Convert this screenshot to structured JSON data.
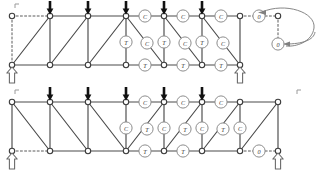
{
  "figure": {
    "colors": {
      "member": "#4a4a4a",
      "node_stroke": "#3d3d3d",
      "node_fill": "#ffffff",
      "label_circle": "#8d8d8d",
      "label_text": "#3a3a3a",
      "load_arrow": "#111111",
      "support": "#6a6a6a",
      "dashed": "#5a5a5a",
      "callout": "#808080",
      "background": "#ffffff"
    },
    "legend_meaning": {
      "C": "compression",
      "T": "tension",
      "0": "zero-force member"
    }
  },
  "trusses": [
    {
      "id": "upper-truss",
      "name": "upper-truss",
      "top_chord_y": 16,
      "bottom_chord_y": 65,
      "panel_x": [
        12,
        50,
        88,
        126,
        164,
        202,
        240,
        278
      ],
      "loads": [
        {
          "name": "load-arrow-1",
          "x": 50
        },
        {
          "name": "load-arrow-2",
          "x": 88
        },
        {
          "name": "load-arrow-3",
          "x": 126
        },
        {
          "name": "load-arrow-4",
          "x": 164
        },
        {
          "name": "load-arrow-5",
          "x": 202
        }
      ],
      "supports": [
        {
          "name": "support-left",
          "x": 12,
          "y": 65
        },
        {
          "name": "support-right",
          "x": 240,
          "y": 65
        }
      ],
      "top_nodes": [
        12,
        50,
        88,
        126,
        164,
        202,
        240,
        278
      ],
      "bottom_nodes": [
        12,
        50,
        88,
        126,
        164,
        202,
        240
      ],
      "dashed_members": [
        {
          "name": "dashed-top-overhang-left",
          "x1": 12,
          "y1": 16,
          "x2": 50,
          "y2": 16
        },
        {
          "name": "dashed-vertical-left",
          "x1": 12,
          "y1": 16,
          "x2": 12,
          "y2": 65
        },
        {
          "name": "dashed-top-overhang-right",
          "x1": 240,
          "y1": 16,
          "x2": 278,
          "y2": 16
        },
        {
          "name": "dashed-vertical-right",
          "x1": 278,
          "y1": 16,
          "x2": 278,
          "y2": 44
        }
      ],
      "labels": [
        {
          "name": "force-label-top-1",
          "x": 145,
          "y": 16,
          "text": "C"
        },
        {
          "name": "force-label-top-2",
          "x": 183,
          "y": 16,
          "text": "C"
        },
        {
          "name": "force-label-top-3",
          "x": 221,
          "y": 16,
          "text": "C"
        },
        {
          "name": "force-label-top-4",
          "x": 259,
          "y": 16,
          "text": "0"
        },
        {
          "name": "force-label-mid-1",
          "x": 126,
          "y": 42,
          "text": "T"
        },
        {
          "name": "force-label-mid-2",
          "x": 147,
          "y": 43,
          "text": "C"
        },
        {
          "name": "force-label-mid-3",
          "x": 164,
          "y": 42,
          "text": "T"
        },
        {
          "name": "force-label-mid-4",
          "x": 185,
          "y": 43,
          "text": "C"
        },
        {
          "name": "force-label-mid-5",
          "x": 202,
          "y": 42,
          "text": "T"
        },
        {
          "name": "force-label-mid-6",
          "x": 223,
          "y": 43,
          "text": "C"
        },
        {
          "name": "force-label-mid-7",
          "x": 278,
          "y": 44,
          "text": "0"
        },
        {
          "name": "force-label-bot-1",
          "x": 145,
          "y": 65,
          "text": "T"
        },
        {
          "name": "force-label-bot-2",
          "x": 183,
          "y": 65,
          "text": "T"
        },
        {
          "name": "force-label-bot-3",
          "x": 221,
          "y": 65,
          "text": "T"
        }
      ],
      "callouts": [
        {
          "name": "callout-arrow-to-top-zero",
          "target_x": 259,
          "target_y": 16
        },
        {
          "name": "callout-arrow-to-vertical-zero",
          "target_x": 278,
          "target_y": 44
        }
      ]
    },
    {
      "id": "lower-truss",
      "name": "lower-truss",
      "top_chord_y": 102,
      "bottom_chord_y": 151,
      "panel_x": [
        12,
        50,
        88,
        126,
        164,
        202,
        240,
        278
      ],
      "loads": [
        {
          "name": "load-arrow-1",
          "x": 50
        },
        {
          "name": "load-arrow-2",
          "x": 88
        },
        {
          "name": "load-arrow-3",
          "x": 126
        },
        {
          "name": "load-arrow-4",
          "x": 164
        },
        {
          "name": "load-arrow-5",
          "x": 202
        }
      ],
      "supports": [
        {
          "name": "support-left",
          "x": 12,
          "y": 151
        },
        {
          "name": "support-right",
          "x": 278,
          "y": 151
        }
      ],
      "top_nodes": [
        12,
        50,
        88,
        126,
        164,
        202,
        240,
        278
      ],
      "bottom_nodes": [
        12,
        50,
        88,
        126,
        164,
        202,
        240,
        278
      ],
      "dashed_members": [
        {
          "name": "dashed-bottom-left",
          "x1": 12,
          "y1": 151,
          "x2": 50,
          "y2": 151
        },
        {
          "name": "dashed-bottom-right",
          "x1": 240,
          "y1": 151,
          "x2": 278,
          "y2": 151
        }
      ],
      "labels": [
        {
          "name": "force-label-top-1",
          "x": 145,
          "y": 102,
          "text": "C"
        },
        {
          "name": "force-label-top-2",
          "x": 183,
          "y": 102,
          "text": "C"
        },
        {
          "name": "force-label-top-3",
          "x": 221,
          "y": 102,
          "text": "C"
        },
        {
          "name": "force-label-mid-0",
          "x": 126,
          "y": 128,
          "text": "C"
        },
        {
          "name": "force-label-mid-1",
          "x": 147,
          "y": 129,
          "text": "T"
        },
        {
          "name": "force-label-mid-2",
          "x": 164,
          "y": 128,
          "text": "C"
        },
        {
          "name": "force-label-mid-3",
          "x": 185,
          "y": 129,
          "text": "T"
        },
        {
          "name": "force-label-mid-4",
          "x": 202,
          "y": 128,
          "text": "C"
        },
        {
          "name": "force-label-mid-5",
          "x": 223,
          "y": 129,
          "text": "T"
        },
        {
          "name": "force-label-mid-6",
          "x": 240,
          "y": 128,
          "text": "C"
        },
        {
          "name": "force-label-bot-1",
          "x": 145,
          "y": 151,
          "text": "T"
        },
        {
          "name": "force-label-bot-2",
          "x": 183,
          "y": 151,
          "text": "T"
        },
        {
          "name": "force-label-bot-3",
          "x": 259,
          "y": 151,
          "text": "0"
        }
      ],
      "corner_marks": [
        {
          "name": "corner-mark-left",
          "x": 15,
          "y": 90
        },
        {
          "name": "corner-mark-right",
          "x": 297,
          "y": 90
        }
      ]
    }
  ]
}
